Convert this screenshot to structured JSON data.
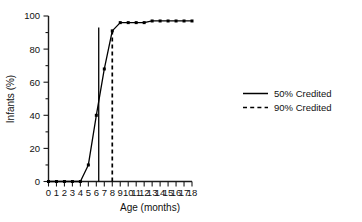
{
  "chart_data": {
    "type": "line",
    "title": "",
    "xlabel": "Age  (months)",
    "ylabel": "Infants  (%)",
    "x": [
      0,
      1,
      2,
      3,
      4,
      5,
      6,
      7,
      8,
      9,
      10,
      11,
      12,
      13,
      14,
      15,
      16,
      17,
      18
    ],
    "values": [
      0,
      0,
      0,
      0,
      0,
      10,
      40,
      68,
      91,
      96,
      96,
      96,
      96,
      97,
      97,
      97,
      97,
      97,
      97
    ],
    "xlim": [
      0,
      18
    ],
    "ylim": [
      0,
      100
    ],
    "xticks": [
      0,
      1,
      2,
      3,
      4,
      5,
      6,
      7,
      8,
      9,
      10,
      11,
      12,
      13,
      14,
      15,
      16,
      17,
      18
    ],
    "xticklabels": [
      "0",
      "1",
      "2",
      "3",
      "4",
      "5",
      "6",
      "7",
      "8",
      "9",
      "10",
      "11",
      "12",
      "13",
      "14",
      "15",
      "16",
      "17",
      "18"
    ],
    "yticks": [
      0,
      20,
      40,
      60,
      80,
      100
    ],
    "yticklabels": [
      "0",
      "20",
      "40",
      "60",
      "80",
      "100"
    ],
    "grid": false,
    "marker": "square",
    "line_color": "#000000",
    "reference_lines": [
      {
        "name": "50% Credited",
        "x": 6.3,
        "style": "solid"
      },
      {
        "name": "90% Credited",
        "x": 8.0,
        "style": "dashed"
      }
    ],
    "legend_position": "right",
    "legend": [
      {
        "label": "50% Credited",
        "style": "solid"
      },
      {
        "label": "90% Credited",
        "style": "dashed"
      }
    ]
  }
}
